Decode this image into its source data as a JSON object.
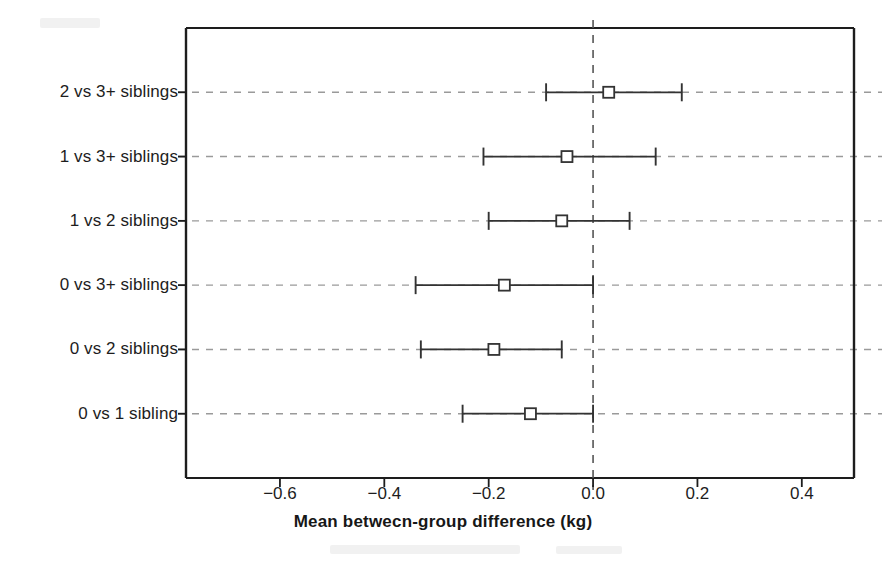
{
  "chart_data": {
    "type": "scatter",
    "title": "",
    "xlabel": "Mean betwecn-group difference (kg)",
    "ylabel": "",
    "xlim": [
      -0.78,
      0.5
    ],
    "ylim": [
      0,
      6
    ],
    "grid": true,
    "legend": null,
    "orientation": "horizontal",
    "marker": "open-square",
    "error_bars": "horizontal-capped",
    "reference_line": {
      "value": 0.0,
      "style": "dashed",
      "orientation": "vertical"
    },
    "xticks": [
      -0.6,
      -0.4,
      -0.2,
      0.0,
      0.2,
      0.4
    ],
    "xtick_labels": [
      "-0.6",
      "-0.4",
      "-0.2",
      "0.0",
      "0.2",
      "0.4"
    ],
    "categories": [
      "2 vs 3+ siblings",
      "1 vs 3+ siblings",
      "1 vs 2 siblings",
      "0 vs 3+ siblings",
      "0 vs 2 siblings",
      "0 vs 1 sibling"
    ],
    "values": [
      0.03,
      -0.05,
      -0.06,
      -0.17,
      -0.19,
      -0.12
    ],
    "lower": [
      -0.09,
      -0.21,
      -0.2,
      -0.34,
      -0.33,
      -0.25
    ],
    "upper": [
      0.17,
      0.12,
      0.07,
      0.0,
      -0.06,
      0.0
    ],
    "points": [
      {
        "category": "2 vs 3+ siblings",
        "mean": 0.03,
        "lower": -0.09,
        "upper": 0.17
      },
      {
        "category": "1 vs 3+ siblings",
        "mean": -0.05,
        "lower": -0.21,
        "upper": 0.12
      },
      {
        "category": "1 vs 2 siblings",
        "mean": -0.06,
        "lower": -0.2,
        "upper": 0.07
      },
      {
        "category": "0 vs 3+ siblings",
        "mean": -0.17,
        "lower": -0.34,
        "upper": 0.0
      },
      {
        "category": "0 vs 2 siblings",
        "mean": -0.19,
        "lower": -0.33,
        "upper": -0.06
      },
      {
        "category": "0 vs 1 sibling",
        "mean": -0.12,
        "lower": -0.25,
        "upper": 0.0
      }
    ]
  },
  "colors": {
    "axis": "#1d1d1d",
    "grid": "#9a9a9a",
    "marker": "#333333",
    "reference_line": "#555555",
    "background": "#ffffff"
  }
}
